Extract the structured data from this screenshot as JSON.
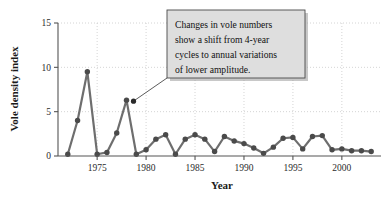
{
  "chart_data": {
    "type": "line",
    "title": "",
    "xlabel": "Year",
    "ylabel": "Vole density index",
    "xlim": [
      1971,
      2004
    ],
    "ylim": [
      0,
      15
    ],
    "yticks": [
      0,
      5,
      10,
      15
    ],
    "ytick_labels": [
      "0",
      "5",
      "10",
      "15"
    ],
    "xticks": [
      1975,
      1980,
      1985,
      1990,
      1995,
      2000
    ],
    "xtick_labels": [
      "1975",
      "1980",
      "1985",
      "1990",
      "1995",
      "2000"
    ],
    "grid": "dotted-light",
    "legend": "none",
    "marker": "filled-circle",
    "series": [
      {
        "name": "Vole density index",
        "x": [
          1972,
          1973,
          1974,
          1975,
          1976,
          1977,
          1978,
          1979,
          1980,
          1981,
          1982,
          1983,
          1984,
          1985,
          1986,
          1987,
          1988,
          1989,
          1990,
          1991,
          1992,
          1993,
          1994,
          1995,
          1996,
          1997,
          1998,
          1999,
          2000,
          2001,
          2002,
          2003
        ],
        "values": [
          0.2,
          4.0,
          9.5,
          0.2,
          0.4,
          2.6,
          6.3,
          0.2,
          0.7,
          1.9,
          2.4,
          0.2,
          1.9,
          2.4,
          1.9,
          0.5,
          2.2,
          1.7,
          1.4,
          0.9,
          0.3,
          1.0,
          2.0,
          2.1,
          0.8,
          2.2,
          2.3,
          0.7,
          0.8,
          0.6,
          0.6,
          0.5
        ]
      }
    ],
    "annotations": [
      {
        "id": "vole-shift-note",
        "text": "Changes in vole numbers show a shift from 4-year cycles to annual variations of lower amplitude.",
        "lines": [
          "Changes in vole numbers",
          "show a shift from 4-year",
          "cycles to annual variations",
          "of lower amplitude."
        ],
        "points_to_year": 1978,
        "points_to_value": 6.3
      }
    ],
    "colors": {
      "line": "#6e6e6e",
      "marker": "#4a4a4a",
      "axis": "#555555",
      "grid": "#c9c9c9",
      "annotation_fill": "#dedede",
      "annotation_border": "#4a4a4a",
      "text": "#1a1a1a",
      "background": "#ffffff"
    }
  }
}
